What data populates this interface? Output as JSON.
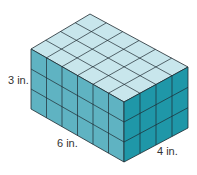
{
  "figure": {
    "type": "rectangular prism made of unit cubes",
    "length_units": 6,
    "width_units": 4,
    "height_units": 3,
    "labels": {
      "height": "3 in.",
      "length": "6 in.",
      "width": "4 in."
    },
    "colors": {
      "top_face": "#c8e6ec",
      "front_face": "#5fb3c2",
      "side_face": "#1f97a8",
      "grid_line": "#1e2a30"
    }
  }
}
